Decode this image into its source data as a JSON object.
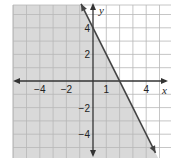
{
  "chart_data": {
    "type": "line",
    "title": "",
    "xlabel": "x",
    "ylabel": "y",
    "xlim": [
      -6,
      5.9
    ],
    "ylim": [
      -5.8,
      5.7
    ],
    "grid": true,
    "x_tick_labels": [
      {
        "value": -4,
        "label": "−4"
      },
      {
        "value": -2,
        "label": "−2"
      },
      {
        "value": 1,
        "label": "1"
      },
      {
        "value": 4,
        "label": "4"
      }
    ],
    "y_tick_labels": [
      {
        "value": 4,
        "label": "4"
      },
      {
        "value": 2,
        "label": "2"
      },
      {
        "value": -2,
        "label": "−2"
      },
      {
        "value": -4,
        "label": "−4"
      }
    ],
    "series": [
      {
        "name": "boundary line",
        "equation": "y = -2x + 4",
        "slope": -2,
        "intercept": 4,
        "style": "solid",
        "points": [
          [
            -0.9,
            5.8
          ],
          [
            0,
            4
          ],
          [
            2,
            0
          ],
          [
            4.7,
            -5.4
          ]
        ]
      }
    ],
    "shaded_region": {
      "inequality": "y ≤ -2x + 4",
      "side": "below-left",
      "color": "#d9d9d9"
    },
    "colors": {
      "grid": "#b8b8b8",
      "axis": "#333333",
      "line": "#444444",
      "shade": "#d9d9d9"
    }
  }
}
